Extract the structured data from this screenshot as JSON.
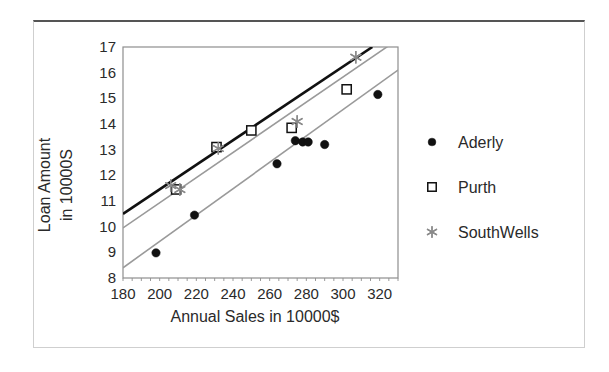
{
  "chart_data": {
    "type": "scatter",
    "title": "",
    "xlabel": "Annual Sales in 10000$",
    "ylabel": "Loan Amount in 10000S",
    "ylabel_line1": "Loan Amount",
    "ylabel_line2": "in 10000S",
    "xlim": [
      180,
      330
    ],
    "ylim": [
      8,
      17
    ],
    "xticks": [
      180,
      200,
      220,
      240,
      260,
      280,
      300,
      320
    ],
    "yticks": [
      8,
      9,
      10,
      11,
      12,
      13,
      14,
      15,
      16,
      17
    ],
    "grid": false,
    "legend_position": "right",
    "series": [
      {
        "name": "Aderly",
        "marker": "filled-circle",
        "color": "#111111",
        "points": [
          [
            198,
            8.98
          ],
          [
            219,
            10.45
          ],
          [
            264,
            12.45
          ],
          [
            274,
            13.35
          ],
          [
            278,
            13.3
          ],
          [
            281,
            13.3
          ],
          [
            290,
            13.2
          ],
          [
            319,
            15.15
          ]
        ],
        "fit_line": {
          "x1": 180,
          "y1": 8.4,
          "x2": 330,
          "y2": 16.1,
          "color": "#9a9a9a"
        }
      },
      {
        "name": "Purth",
        "marker": "open-square",
        "color": "#111111",
        "points": [
          [
            209,
            11.45
          ],
          [
            231,
            13.1
          ],
          [
            250,
            13.75
          ],
          [
            272,
            13.85
          ],
          [
            302,
            15.35
          ]
        ],
        "fit_line": {
          "x1": 180,
          "y1": 10.5,
          "x2": 316,
          "y2": 17.0,
          "color": "#111111"
        }
      },
      {
        "name": "SouthWells",
        "marker": "asterisk",
        "color": "#8a8a8a",
        "points": [
          [
            206,
            11.6
          ],
          [
            211,
            11.45
          ],
          [
            232,
            13.05
          ],
          [
            275,
            14.1
          ],
          [
            307,
            16.6
          ]
        ],
        "fit_line": {
          "x1": 180,
          "y1": 9.95,
          "x2": 330,
          "y2": 17.3,
          "color": "#9a9a9a"
        }
      }
    ],
    "legend": [
      {
        "label": "Aderly",
        "marker": "filled-circle"
      },
      {
        "label": "Purth",
        "marker": "open-square"
      },
      {
        "label": "SouthWells",
        "marker": "asterisk"
      }
    ]
  }
}
